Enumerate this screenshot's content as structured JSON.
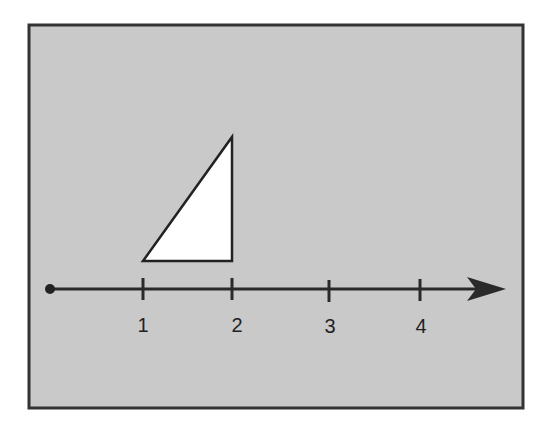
{
  "diagram": {
    "background_color": "#c9c9c9",
    "frame_color": "#333333",
    "shape": {
      "type": "right-triangle",
      "fill": "#ffffff",
      "stroke": "#222222",
      "vertices": [
        [
          1,
          0
        ],
        [
          2,
          0
        ],
        [
          2,
          1.35
        ]
      ]
    },
    "number_line": {
      "start_marker": "closed-dot",
      "end_marker": "arrow",
      "ticks": [
        {
          "value": 1,
          "label": "1"
        },
        {
          "value": 2,
          "label": "2"
        },
        {
          "value": 3,
          "label": "3"
        },
        {
          "value": 4,
          "label": "4"
        }
      ]
    }
  }
}
